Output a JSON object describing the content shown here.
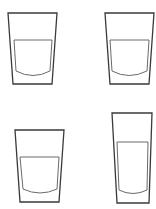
{
  "figure": {
    "stroke_color": "#3a3a3a",
    "water_stroke_color": "#6a6a6a",
    "background": "#ffffff"
  },
  "glasses": [
    {
      "id": "A",
      "position": "top-left",
      "shape": "wide tapered tumbler"
    },
    {
      "id": "B",
      "position": "top-right",
      "shape": "wide tapered tumbler"
    },
    {
      "id": "C",
      "position": "bottom-left",
      "shape": "wide tapered tumbler"
    },
    {
      "id": "D",
      "position": "bottom-right",
      "shape": "tall narrow tumbler"
    }
  ]
}
